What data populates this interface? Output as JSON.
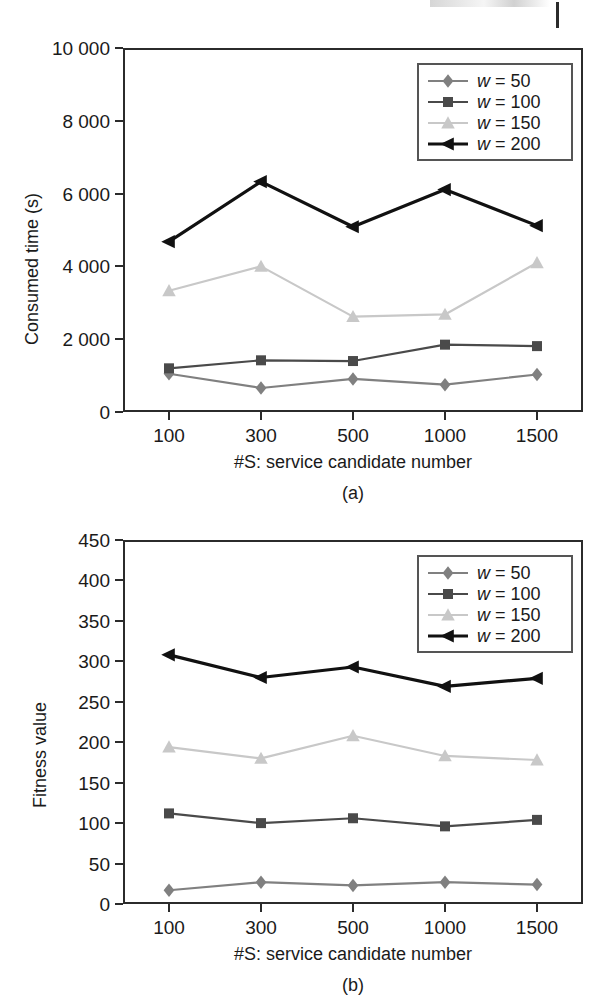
{
  "figure": {
    "subcaption_a": "(a)",
    "subcaption_b": "(b)"
  },
  "legend": {
    "entries": [
      {
        "label": "w = 50",
        "w": "50",
        "color": "#808080",
        "marker": "diamond"
      },
      {
        "label": "w = 100",
        "w": "100",
        "color": "#4a4a4a",
        "marker": "square"
      },
      {
        "label": "w = 150",
        "w": "150",
        "color": "#c8c8c8",
        "marker": "triangle"
      },
      {
        "label": "w = 200",
        "w": "200",
        "color": "#111111",
        "marker": "left-triangle"
      }
    ]
  },
  "chart_data": [
    {
      "type": "line",
      "panel": "(a)",
      "title": "",
      "xlabel": "#S: service candidate number",
      "ylabel": "Consumed time (s)",
      "categories": [
        "100",
        "300",
        "500",
        "1000",
        "1500"
      ],
      "x_tick_labels": [
        "100",
        "300",
        "500",
        "1000",
        "1500"
      ],
      "y_tick_labels": [
        "0",
        "2 000",
        "4 000",
        "6 000",
        "8 000",
        "10 000"
      ],
      "y_ticks": [
        0,
        2000,
        4000,
        6000,
        8000,
        10000
      ],
      "ylim": [
        0,
        10000
      ],
      "grid": false,
      "legend_position": "top-right",
      "series": [
        {
          "name": "w = 50",
          "color": "#808080",
          "marker": "diamond",
          "values": [
            1050,
            660,
            910,
            750,
            1030
          ]
        },
        {
          "name": "w = 100",
          "color": "#4a4a4a",
          "marker": "square",
          "values": [
            1200,
            1420,
            1400,
            1850,
            1810
          ]
        },
        {
          "name": "w = 150",
          "color": "#c8c8c8",
          "marker": "triangle",
          "values": [
            3330,
            4000,
            2620,
            2680,
            4100
          ]
        },
        {
          "name": "w = 200",
          "color": "#111111",
          "marker": "left-triangle",
          "values": [
            4680,
            6330,
            5090,
            6110,
            5120
          ]
        }
      ]
    },
    {
      "type": "line",
      "panel": "(b)",
      "title": "",
      "xlabel": "#S: service candidate number",
      "ylabel": "Fitness value",
      "categories": [
        "100",
        "300",
        "500",
        "1000",
        "1500"
      ],
      "x_tick_labels": [
        "100",
        "300",
        "500",
        "1000",
        "1500"
      ],
      "y_tick_labels": [
        "0",
        "50",
        "100",
        "150",
        "200",
        "250",
        "300",
        "350",
        "400",
        "450"
      ],
      "y_ticks": [
        0,
        50,
        100,
        150,
        200,
        250,
        300,
        350,
        400,
        450
      ],
      "ylim": [
        0,
        450
      ],
      "grid": false,
      "legend_position": "top-right",
      "series": [
        {
          "name": "w = 50",
          "color": "#808080",
          "marker": "diamond",
          "values": [
            17,
            27,
            23,
            27,
            24
          ]
        },
        {
          "name": "w = 100",
          "color": "#4a4a4a",
          "marker": "square",
          "values": [
            112,
            100,
            106,
            96,
            104
          ]
        },
        {
          "name": "w = 150",
          "color": "#c8c8c8",
          "marker": "triangle",
          "values": [
            194,
            180,
            208,
            183,
            178
          ]
        },
        {
          "name": "w = 200",
          "color": "#111111",
          "marker": "left-triangle",
          "values": [
            308,
            280,
            293,
            269,
            279
          ]
        }
      ]
    }
  ]
}
